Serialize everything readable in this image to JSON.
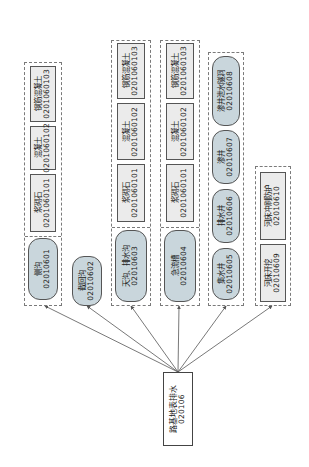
{
  "root": {
    "label": "路基地表排水",
    "code": "020106"
  },
  "groups": [
    {
      "id": "g1",
      "nodes": [
        {
          "label": "侧沟",
          "code": "02010601",
          "shape": "pill"
        },
        {
          "label": "浆砌石",
          "code": "0201060101",
          "shape": "rect"
        },
        {
          "label": "混凝土",
          "code": "0201060102",
          "shape": "rect"
        },
        {
          "label": "钢筋混凝土",
          "code": "0201060103",
          "shape": "rect"
        }
      ]
    },
    {
      "id": "g2",
      "nodes": [
        {
          "label": "截回沟",
          "code": "02010602",
          "shape": "pill"
        }
      ]
    },
    {
      "id": "g3",
      "nodes": [
        {
          "label": "天沟、排水沟",
          "code": "02010603",
          "shape": "pill"
        },
        {
          "label": "浆砌石",
          "code": "0201060101",
          "shape": "rect"
        },
        {
          "label": "混凝土",
          "code": "0201060102",
          "shape": "rect"
        },
        {
          "label": "钢筋混凝土",
          "code": "0201060103",
          "shape": "rect"
        }
      ]
    },
    {
      "id": "g4",
      "nodes": [
        {
          "label": "急流槽",
          "code": "02010604",
          "shape": "pill"
        },
        {
          "label": "浆砌石",
          "code": "0201060101",
          "shape": "rect"
        },
        {
          "label": "混凝土",
          "code": "0201060102",
          "shape": "rect"
        },
        {
          "label": "钢筋混凝土",
          "code": "0201060103",
          "shape": "rect"
        }
      ]
    },
    {
      "id": "g5",
      "nodes": [
        {
          "label": "集水井",
          "code": "02010605",
          "shape": "pill"
        },
        {
          "label": "排水井",
          "code": "02010606",
          "shape": "pill"
        },
        {
          "label": "渗井",
          "code": "02010607",
          "shape": "pill"
        },
        {
          "label": "渗井泄水隧洞",
          "code": "02010608",
          "shape": "pill"
        }
      ]
    },
    {
      "id": "g6",
      "nodes": [
        {
          "label": "河床开挖",
          "code": "02010609",
          "shape": "rect"
        },
        {
          "label": "河床冲刷防护",
          "code": "02010610",
          "shape": "rect"
        }
      ]
    }
  ],
  "colors": {
    "pill_fill": "#c9d6dc",
    "rect_fill": "#ebebeb",
    "border": "#555555",
    "dashed": "#7a7a7a",
    "link": "#555555"
  }
}
